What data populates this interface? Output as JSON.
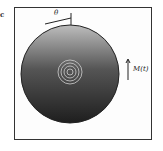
{
  "figure": {
    "panel_label": "c",
    "labels": {
      "angle": "θ",
      "magnetization": "M(t)"
    },
    "elements": [
      "square frame",
      "shaded disk",
      "concentric rings at center",
      "angle indicator at top",
      "vertical arrow at right"
    ],
    "colors": {
      "ink": "#222222",
      "background": "#ffffff"
    }
  }
}
